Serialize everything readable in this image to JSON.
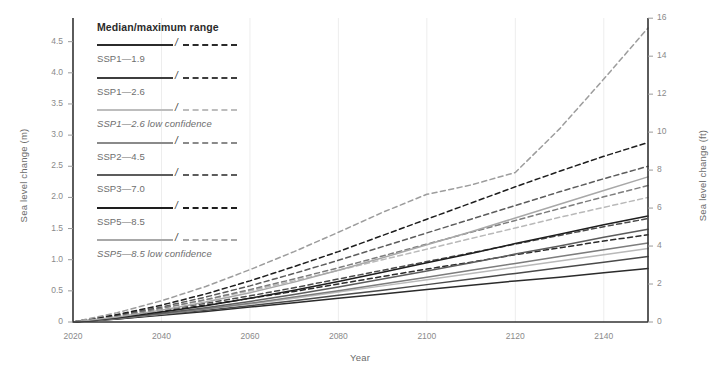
{
  "chart_data": {
    "type": "line",
    "title": "",
    "xlabel": "Year",
    "ylabel": "Sea level change (m)",
    "ylabel_right": "Sea level change (ft)",
    "xlim": [
      2020,
      2150
    ],
    "ylim": [
      0,
      4.88
    ],
    "ylim_right": [
      0,
      16
    ],
    "xticks": [
      2020,
      2040,
      2060,
      2080,
      2100,
      2120,
      2140
    ],
    "yticks": [
      0,
      0.5,
      1.0,
      1.5,
      2.0,
      2.5,
      3.0,
      3.5,
      4.0,
      4.5
    ],
    "ytick_labels": [
      "0",
      "0.5",
      "1.0",
      "1.5",
      "2.0",
      "2.5",
      "3.0",
      "3.5",
      "4.0",
      "4.5"
    ],
    "yticks_right": [
      0,
      2,
      4,
      6,
      8,
      10,
      12,
      14,
      16
    ],
    "ytick_labels_right": [
      "0",
      "2",
      "4",
      "6",
      "8",
      "10",
      "12",
      "14",
      "16"
    ],
    "grid": "vertical-only",
    "legend_position": "upper-left-inside",
    "x": [
      2020,
      2030,
      2040,
      2050,
      2060,
      2070,
      2080,
      2090,
      2100,
      2110,
      2120,
      2130,
      2140,
      2150
    ],
    "series": [
      {
        "name": "SSP1—1.9 median",
        "style": "solid",
        "color": "#2b2b2b",
        "values": [
          0,
          0.05,
          0.11,
          0.17,
          0.24,
          0.31,
          0.38,
          0.45,
          0.52,
          0.59,
          0.66,
          0.72,
          0.79,
          0.86
        ]
      },
      {
        "name": "SSP1—1.9 maximum",
        "style": "dashed",
        "color": "#2b2b2b",
        "values": [
          0,
          0.08,
          0.17,
          0.27,
          0.38,
          0.49,
          0.61,
          0.73,
          0.85,
          0.96,
          1.08,
          1.19,
          1.3,
          1.4
        ]
      },
      {
        "name": "SSP1—2.6 median",
        "style": "solid",
        "color": "#4a4a4a",
        "values": [
          0,
          0.05,
          0.12,
          0.19,
          0.26,
          0.34,
          0.43,
          0.51,
          0.6,
          0.69,
          0.78,
          0.87,
          0.96,
          1.05
        ]
      },
      {
        "name": "SSP1—2.6 maximum",
        "style": "dashed",
        "color": "#4a4a4a",
        "values": [
          0,
          0.09,
          0.19,
          0.3,
          0.42,
          0.55,
          0.69,
          0.83,
          0.97,
          1.11,
          1.25,
          1.39,
          1.53,
          1.66
        ]
      },
      {
        "name": "SSP1—2.6 low confidence median",
        "style": "solid",
        "color": "#b9b9b9",
        "values": [
          0,
          0.06,
          0.13,
          0.21,
          0.29,
          0.38,
          0.48,
          0.58,
          0.68,
          0.78,
          0.88,
          0.98,
          1.08,
          1.18
        ]
      },
      {
        "name": "SSP1—2.6 low confidence maximum",
        "style": "dashed",
        "color": "#b9b9b9",
        "values": [
          0,
          0.1,
          0.22,
          0.35,
          0.5,
          0.66,
          0.83,
          1.0,
          1.17,
          1.34,
          1.51,
          1.68,
          1.84,
          2.0
        ]
      },
      {
        "name": "SSP2—4.5 median",
        "style": "solid",
        "color": "#7d7d7d",
        "values": [
          0,
          0.06,
          0.13,
          0.21,
          0.3,
          0.4,
          0.5,
          0.61,
          0.72,
          0.83,
          0.94,
          1.05,
          1.16,
          1.27
        ]
      },
      {
        "name": "SSP2—4.5 maximum",
        "style": "dashed",
        "color": "#7d7d7d",
        "values": [
          0,
          0.1,
          0.22,
          0.36,
          0.52,
          0.69,
          0.87,
          1.06,
          1.25,
          1.44,
          1.63,
          1.82,
          2.01,
          2.19
        ]
      },
      {
        "name": "SSP3—7.0 median",
        "style": "solid",
        "color": "#5c5c5c",
        "values": [
          0,
          0.06,
          0.14,
          0.23,
          0.33,
          0.44,
          0.56,
          0.69,
          0.82,
          0.95,
          1.09,
          1.22,
          1.36,
          1.49
        ]
      },
      {
        "name": "SSP3—7.0 maximum",
        "style": "dashed",
        "color": "#5c5c5c",
        "values": [
          0,
          0.11,
          0.24,
          0.4,
          0.58,
          0.78,
          0.99,
          1.21,
          1.43,
          1.65,
          1.87,
          2.09,
          2.3,
          2.5
        ]
      },
      {
        "name": "SSP5—8.5 median",
        "style": "solid",
        "color": "#1e1e1e",
        "values": [
          0,
          0.07,
          0.16,
          0.26,
          0.38,
          0.51,
          0.65,
          0.8,
          0.95,
          1.1,
          1.26,
          1.41,
          1.56,
          1.7
        ]
      },
      {
        "name": "SSP5—8.5 maximum",
        "style": "dashed",
        "color": "#1e1e1e",
        "values": [
          0,
          0.12,
          0.27,
          0.45,
          0.66,
          0.89,
          1.13,
          1.39,
          1.65,
          1.91,
          2.17,
          2.42,
          2.66,
          2.88
        ]
      },
      {
        "name": "SSP5—8.5 low confidence median",
        "style": "solid",
        "color": "#a8a8a8",
        "values": [
          0,
          0.08,
          0.19,
          0.32,
          0.47,
          0.64,
          0.83,
          1.03,
          1.24,
          1.45,
          1.67,
          1.89,
          2.11,
          2.33
        ]
      },
      {
        "name": "SSP5—8.5 low confidence maximum",
        "style": "dashed",
        "color": "#9d9d9d",
        "values": [
          0,
          0.15,
          0.34,
          0.57,
          0.84,
          1.13,
          1.44,
          1.76,
          2.05,
          2.2,
          2.4,
          3.1,
          3.9,
          4.72
        ]
      }
    ]
  },
  "axes": {
    "left_title": "Sea level change (m)",
    "right_title": "Sea level change (ft)",
    "x_title": "Year"
  },
  "legend": {
    "title": "Median/maximum range",
    "separator": "/",
    "entries": [
      {
        "label": "SSP1—1.9",
        "color": "#2b2b2b",
        "italic": false
      },
      {
        "label": "SSP1—2.6",
        "color": "#3d3d3d",
        "italic": false
      },
      {
        "label": "SSP1—2.6 low confidence",
        "color": "#bdbdbd",
        "italic": true
      },
      {
        "label": "SSP2—4.5",
        "color": "#8a8a8a",
        "italic": false
      },
      {
        "label": "SSP3—7.0",
        "color": "#5c5c5c",
        "italic": false
      },
      {
        "label": "SSP5—8.5",
        "color": "#1e1e1e",
        "italic": false
      },
      {
        "label": "SSP5—8.5 low confidence",
        "color": "#a8a8a8",
        "italic": true
      }
    ]
  },
  "colors": {
    "background": "#ffffff",
    "axis": "#333333",
    "gridline": "#ededed",
    "tick_text": "#8a8a8a"
  }
}
